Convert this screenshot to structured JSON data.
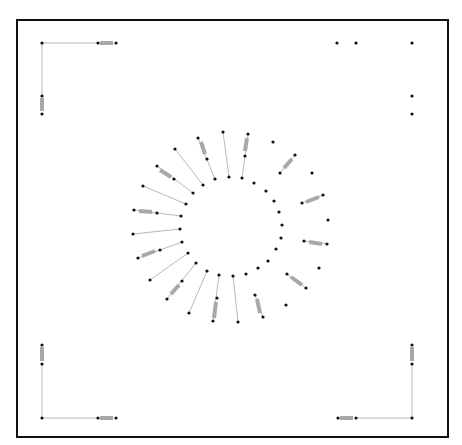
{
  "canvas": {
    "width": 462,
    "height": 445,
    "background": "#ffffff"
  },
  "frame": {
    "x": 17,
    "y": 20,
    "width": 431,
    "height": 417,
    "stroke": "#111111"
  },
  "colors": {
    "wire": "#b8b8b8",
    "resistor": "#a8a8a8",
    "pad": "#111111"
  },
  "wires": [
    [
      42,
      43,
      98,
      43
    ],
    [
      42,
      43,
      42,
      96
    ],
    [
      42,
      418,
      42,
      364
    ],
    [
      42,
      418,
      98,
      418
    ],
    [
      412,
      418,
      356,
      418
    ],
    [
      412,
      418,
      412,
      364
    ],
    [
      175,
      149,
      203,
      185
    ],
    [
      157,
      166,
      193,
      193
    ],
    [
      143,
      186,
      186,
      204
    ],
    [
      134,
      210,
      181,
      216
    ],
    [
      133,
      234,
      180,
      229
    ],
    [
      138,
      258,
      182,
      242
    ],
    [
      150,
      280,
      188,
      253
    ],
    [
      167,
      299,
      196,
      263
    ],
    [
      189,
      313,
      207,
      271
    ],
    [
      213,
      321,
      219,
      275
    ],
    [
      238,
      322,
      233,
      276
    ],
    [
      198,
      138,
      215,
      179
    ],
    [
      223,
      132,
      229,
      177
    ],
    [
      248,
      134,
      242,
      178
    ],
    [
      295,
      155,
      280,
      173
    ],
    [
      323,
      195,
      302,
      203
    ],
    [
      327,
      244,
      304,
      241
    ],
    [
      306,
      288,
      287,
      274
    ],
    [
      263,
      317,
      255,
      295
    ]
  ],
  "resistors": [
    {
      "x1": 100,
      "y1": 43,
      "x2": 113,
      "y2": 43
    },
    {
      "x1": 42,
      "y1": 98,
      "x2": 42,
      "y2": 111
    },
    {
      "x1": 42,
      "y1": 347,
      "x2": 42,
      "y2": 361
    },
    {
      "x1": 100,
      "y1": 418,
      "x2": 113,
      "y2": 418
    },
    {
      "x1": 340,
      "y1": 418,
      "x2": 353,
      "y2": 418
    },
    {
      "x1": 412,
      "y1": 347,
      "x2": 412,
      "y2": 361
    },
    {
      "x1": 160,
      "y1": 170,
      "x2": 171,
      "y2": 177
    },
    {
      "x1": 139,
      "y1": 211,
      "x2": 152,
      "y2": 212
    },
    {
      "x1": 142,
      "y1": 256,
      "x2": 155,
      "y2": 251
    },
    {
      "x1": 171,
      "y1": 294,
      "x2": 179,
      "y2": 285
    },
    {
      "x1": 214,
      "y1": 318,
      "x2": 216,
      "y2": 302
    },
    {
      "x1": 201,
      "y1": 142,
      "x2": 205,
      "y2": 154
    },
    {
      "x1": 247,
      "y1": 138,
      "x2": 245,
      "y2": 151
    },
    {
      "x1": 292,
      "y1": 159,
      "x2": 284,
      "y2": 168
    },
    {
      "x1": 319,
      "y1": 197,
      "x2": 306,
      "y2": 202
    },
    {
      "x1": 322,
      "y1": 244,
      "x2": 309,
      "y2": 242
    },
    {
      "x1": 302,
      "y1": 285,
      "x2": 291,
      "y2": 277
    },
    {
      "x1": 260,
      "y1": 313,
      "x2": 257,
      "y2": 299
    }
  ],
  "pads": [
    [
      42,
      43
    ],
    [
      98,
      43
    ],
    [
      116,
      43
    ],
    [
      42,
      96
    ],
    [
      42,
      114
    ],
    [
      337,
      43
    ],
    [
      356,
      43
    ],
    [
      412,
      43
    ],
    [
      412,
      96
    ],
    [
      412,
      114
    ],
    [
      42,
      345
    ],
    [
      42,
      364
    ],
    [
      42,
      418
    ],
    [
      98,
      418
    ],
    [
      116,
      418
    ],
    [
      412,
      345
    ],
    [
      412,
      364
    ],
    [
      412,
      418
    ],
    [
      338,
      418
    ],
    [
      356,
      418
    ],
    [
      175,
      149
    ],
    [
      203,
      185
    ],
    [
      157,
      166
    ],
    [
      174,
      179
    ],
    [
      193,
      193
    ],
    [
      143,
      186
    ],
    [
      186,
      204
    ],
    [
      134,
      210
    ],
    [
      157,
      213
    ],
    [
      181,
      216
    ],
    [
      133,
      234
    ],
    [
      180,
      229
    ],
    [
      138,
      258
    ],
    [
      160,
      250
    ],
    [
      182,
      242
    ],
    [
      150,
      280
    ],
    [
      188,
      253
    ],
    [
      167,
      299
    ],
    [
      182,
      281
    ],
    [
      196,
      263
    ],
    [
      189,
      313
    ],
    [
      207,
      271
    ],
    [
      213,
      321
    ],
    [
      217,
      298
    ],
    [
      219,
      275
    ],
    [
      238,
      322
    ],
    [
      233,
      276
    ],
    [
      246,
      274
    ],
    [
      258,
      268
    ],
    [
      268,
      261
    ],
    [
      198,
      138
    ],
    [
      207,
      159
    ],
    [
      215,
      179
    ],
    [
      223,
      132
    ],
    [
      229,
      177
    ],
    [
      248,
      134
    ],
    [
      245,
      156
    ],
    [
      242,
      178
    ],
    [
      254,
      183
    ],
    [
      273,
      142
    ],
    [
      295,
      155
    ],
    [
      280,
      173
    ],
    [
      312,
      173
    ],
    [
      266,
      191
    ],
    [
      274,
      201
    ],
    [
      302,
      203
    ],
    [
      323,
      195
    ],
    [
      279,
      212
    ],
    [
      328,
      220
    ],
    [
      282,
      225
    ],
    [
      281,
      238
    ],
    [
      304,
      241
    ],
    [
      327,
      244
    ],
    [
      276,
      249
    ],
    [
      319,
      268
    ],
    [
      287,
      274
    ],
    [
      306,
      288
    ],
    [
      255,
      295
    ],
    [
      286,
      305
    ],
    [
      263,
      317
    ]
  ]
}
